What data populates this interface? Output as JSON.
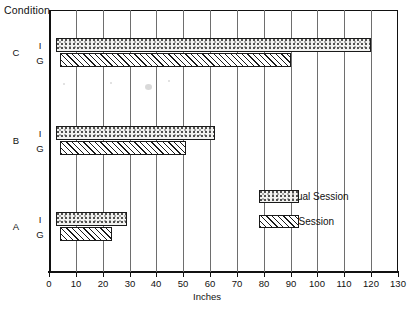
{
  "axis_title": "Condition",
  "chart_data": {
    "type": "bar",
    "orientation": "horizontal",
    "title": "",
    "xlabel": "Inches",
    "ylabel": "Condition",
    "xlim": [
      0,
      130
    ],
    "xticks": [
      0,
      10,
      20,
      30,
      40,
      50,
      60,
      70,
      80,
      90,
      100,
      110,
      120,
      130
    ],
    "xtick_labels": [
      "0",
      "10",
      "20",
      "30",
      "40",
      "50",
      "60",
      "70",
      "80",
      "90",
      "100",
      "110",
      "120",
      "130"
    ],
    "grid": true,
    "grid_axis": "x",
    "legend_position": "center-right",
    "categories": [
      "C",
      "B",
      "A"
    ],
    "series": [
      {
        "name": "Individual Session",
        "key": "individual",
        "pattern": "stipple",
        "values": [
          120,
          62,
          29
        ],
        "starts": [
          2.5,
          2.5,
          2.5
        ]
      },
      {
        "name": "Group Session",
        "key": "group",
        "pattern": "diagonal-hatch",
        "values": [
          90,
          51,
          23.5
        ],
        "starts": [
          4,
          4,
          4
        ]
      }
    ],
    "sub_labels": [
      "I",
      "G"
    ]
  },
  "legend": {
    "items": [
      {
        "label": "Individual Session",
        "pattern": "stipple"
      },
      {
        "label": "Group Session",
        "pattern": "diagonal-hatch"
      }
    ]
  },
  "colors": {
    "ink": "#1a1a1a",
    "grid": "#6e6e6e",
    "paper": "#ffffff",
    "stipple_fill": "#f2f2f0"
  }
}
